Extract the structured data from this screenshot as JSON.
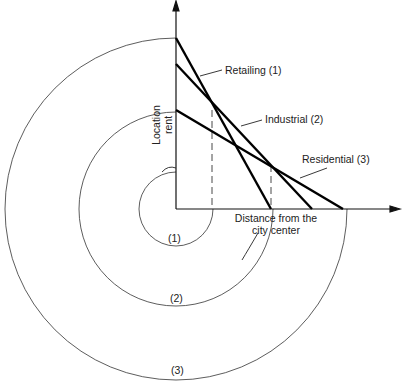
{
  "diagram": {
    "axes": {
      "y_label_line1": "Location",
      "y_label_line2": "rent",
      "x_label_line1": "Distance from the",
      "x_label_line2": "city center"
    },
    "lines": [
      {
        "label": "Retailing (1)"
      },
      {
        "label": "Industrial (2)"
      },
      {
        "label": "Residential (3)"
      }
    ],
    "rings": [
      {
        "label": "(1)"
      },
      {
        "label": "(2)"
      },
      {
        "label": "(3)"
      }
    ]
  }
}
